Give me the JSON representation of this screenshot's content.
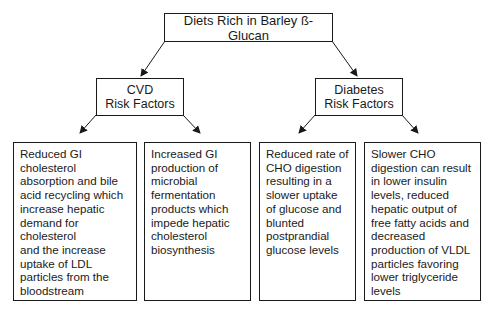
{
  "diagram": {
    "root": {
      "label": "Diets Rich in Barley ß-Glucan"
    },
    "branches": [
      {
        "label_line1": "CVD",
        "label_line2": "Risk Factors",
        "children": [
          {
            "text": "Reduced GI\ncholesterol\nabsorption and bile\nacid recycling which\nincrease hepatic\ndemand for\ncholesterol\nand the increase\nuptake of LDL\nparticles from the\nbloodstream"
          },
          {
            "text": "Increased GI\nproduction of\nmicrobial\nfermentation\nproducts which\nimpede hepatic\ncholesterol\nbiosynthesis"
          }
        ]
      },
      {
        "label_line1": "Diabetes",
        "label_line2": "Risk Factors",
        "children": [
          {
            "text": "Reduced rate of\nCHO digestion\nresulting in a\nslower uptake\nof glucose and\nblunted\npostprandial\nglucose levels"
          },
          {
            "text": "Slower CHO\ndigestion can result\nin lower insulin\nlevels, reduced\nhepatic output of\nfree fatty acids and\ndecreased\nproduction of VLDL\nparticles favoring\nlower triglyceride\nlevels"
          }
        ]
      }
    ],
    "colors": {
      "line": "#1a1a1a",
      "background": "#ffffff"
    }
  }
}
